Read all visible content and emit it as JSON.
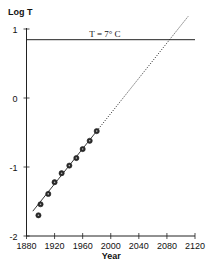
{
  "chart_data": {
    "type": "scatter",
    "title": "",
    "xlabel": "Year",
    "ylabel": "Log T",
    "xlim": [
      1880,
      2120
    ],
    "ylim": [
      -2,
      1
    ],
    "xticks": [
      1880,
      1920,
      1960,
      2000,
      2040,
      2080,
      2120
    ],
    "xtick_labels": [
      "1880",
      "1920",
      "1960",
      "2000",
      "2040",
      "2080",
      "2120"
    ],
    "yticks": [
      1,
      0,
      -1,
      -2
    ],
    "ytick_labels": [
      "1",
      "0",
      "-1",
      "-2"
    ],
    "grid": false,
    "legend": "none",
    "series": [
      {
        "name": "Observed",
        "kind": "points",
        "marker": "dark-circle",
        "x": [
          1897,
          1900,
          1911,
          1920,
          1930,
          1941,
          1951,
          1960,
          1970,
          1980
        ],
        "y": [
          -1.7,
          -1.54,
          -1.39,
          -1.22,
          -1.09,
          -0.98,
          -0.87,
          -0.74,
          -0.62,
          -0.48
        ]
      },
      {
        "name": "Fit",
        "kind": "line",
        "style": "solid",
        "x": [
          1889,
          1980
        ],
        "y": [
          -1.64,
          -0.48
        ]
      },
      {
        "name": "Extrapolation",
        "kind": "line",
        "style": "dotted",
        "x": [
          1980,
          2110
        ],
        "y": [
          -0.48,
          1.18
        ]
      },
      {
        "name": "Threshold",
        "kind": "hline",
        "style": "solid",
        "y": 0.845,
        "x": [
          1880,
          2120
        ]
      }
    ],
    "annotations": [
      {
        "text": "T = 7° C",
        "x": 2000,
        "y": 0.87,
        "anchor": "threshold-line"
      }
    ]
  },
  "colors": {
    "ink": "#222222",
    "marker": "#2a2a2a",
    "background": "#ffffff"
  }
}
